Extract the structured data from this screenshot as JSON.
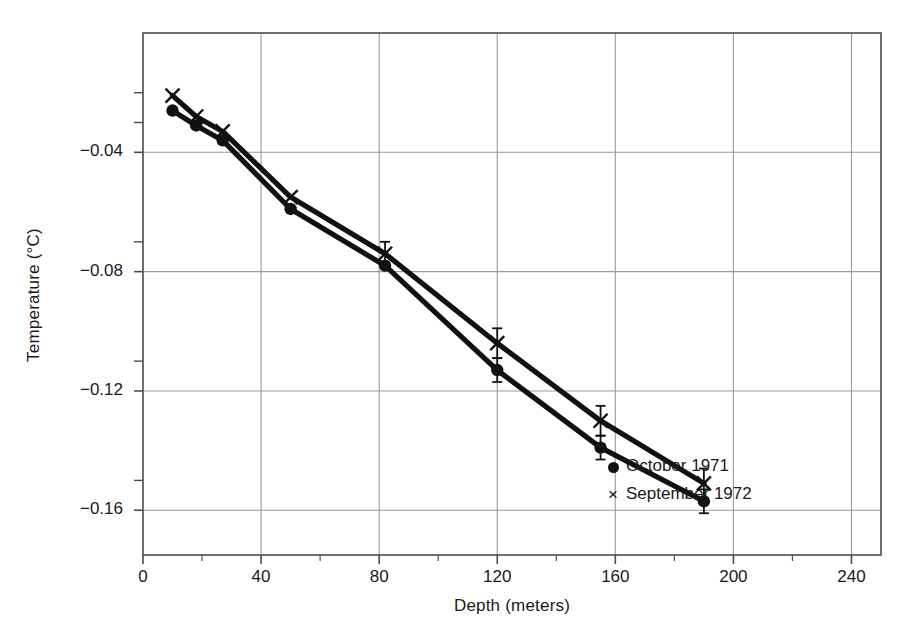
{
  "chart_data": {
    "type": "scatter",
    "title": "",
    "xlabel": "Depth (meters)",
    "ylabel": "Temperature (°C)",
    "xlim": [
      0,
      250
    ],
    "ylim": [
      -0.175,
      0.0
    ],
    "xticks": [
      0,
      40,
      80,
      120,
      160,
      200,
      240
    ],
    "xtick_labels": [
      "0",
      "40",
      "80",
      "120",
      "160",
      "200",
      "240"
    ],
    "xminor_step": 20,
    "yticks": [
      -0.04,
      -0.08,
      -0.12,
      -0.16
    ],
    "ytick_labels": [
      "−0.04",
      "−0.08",
      "−0.12",
      "−0.16"
    ],
    "yminor_step": 0.02,
    "grid": true,
    "legend_position": "inside-lower-right",
    "series": [
      {
        "name": "October 1971",
        "marker": "circle",
        "color": "#111111",
        "points": [
          {
            "x": 10,
            "y": -0.026,
            "yerr": 0.0
          },
          {
            "x": 18,
            "y": -0.031,
            "yerr": 0.0
          },
          {
            "x": 27,
            "y": -0.036,
            "yerr": 0.0
          },
          {
            "x": 50,
            "y": -0.059,
            "yerr": 0.0
          },
          {
            "x": 82,
            "y": -0.078,
            "yerr": 0.0
          },
          {
            "x": 120,
            "y": -0.113,
            "yerr": 0.004
          },
          {
            "x": 155,
            "y": -0.139,
            "yerr": 0.004
          },
          {
            "x": 190,
            "y": -0.157,
            "yerr": 0.004
          }
        ]
      },
      {
        "name": "September 1972",
        "marker": "x",
        "color": "#111111",
        "points": [
          {
            "x": 10,
            "y": -0.021,
            "yerr": 0.0
          },
          {
            "x": 18,
            "y": -0.028,
            "yerr": 0.0
          },
          {
            "x": 27,
            "y": -0.033,
            "yerr": 0.0
          },
          {
            "x": 50,
            "y": -0.055,
            "yerr": 0.0
          },
          {
            "x": 82,
            "y": -0.074,
            "yerr": 0.004
          },
          {
            "x": 120,
            "y": -0.104,
            "yerr": 0.005
          },
          {
            "x": 155,
            "y": -0.13,
            "yerr": 0.005
          },
          {
            "x": 190,
            "y": -0.151,
            "yerr": 0.005
          }
        ]
      }
    ]
  },
  "legend": {
    "entries": [
      {
        "key": "●",
        "label": "October 1971"
      },
      {
        "key": "×",
        "label": "September 1972"
      }
    ]
  },
  "axes": {
    "x_title": "Depth (meters)",
    "y_title": "Temperature (°C)"
  },
  "colors": {
    "ink": "#111111",
    "grid": "#9a9a9a",
    "frame": "#4d4d4d",
    "background": "#ffffff"
  }
}
